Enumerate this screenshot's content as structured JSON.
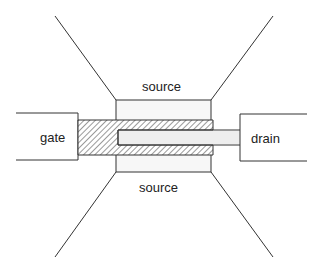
{
  "diagram": {
    "labels": {
      "source_top": "source",
      "source_bottom": "source",
      "gate": "gate",
      "drain": "drain"
    },
    "colors": {
      "stroke": "#333333",
      "hatch": "#555555",
      "drain_fill": "#eeeeee",
      "source_fill": "#f7f7f7"
    }
  }
}
